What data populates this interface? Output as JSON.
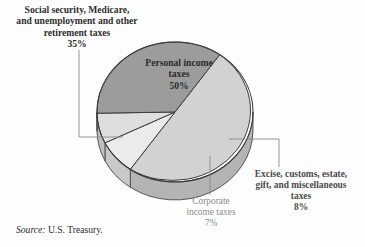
{
  "figure": {
    "source_prefix": "Source:",
    "source_text": " U.S. Treasury."
  },
  "labels": {
    "social": "Social security, Medicare,\nand unemployment and other\nretirement taxes\n35%",
    "personal": "Personal income\ntaxes\n50%",
    "excise": "Excise, customs, estate,\ngift, and miscellaneous\ntaxes\n8%",
    "corporate": "Corporate\nincome taxes\n7%"
  },
  "chart_data": {
    "type": "pie",
    "title": "",
    "subtitle": "",
    "xlabel": "",
    "ylabel": "",
    "legend_position": "callout-labels",
    "grid": false,
    "three_d": true,
    "units": "percent",
    "categories": [
      "Personal income taxes",
      "Excise, customs, estate, gift, and miscellaneous taxes",
      "Corporate income taxes",
      "Social security, Medicare, and unemployment and other retirement taxes"
    ],
    "values": [
      50,
      8,
      7,
      35
    ],
    "slice_labels": [
      "50%",
      "8%",
      "7%",
      "35%"
    ],
    "colors": [
      "#d2d2d2",
      "#ebebeb",
      "#dedede",
      "#9c9c9c"
    ],
    "side_colors": [
      "#b4b4b4",
      "#c9c9c9",
      "#bfbfbf",
      "#848484"
    ],
    "annotations": [
      "Social security, Medicare, and unemployment and other retirement taxes 35%",
      "Personal income taxes 50%",
      "Excise, customs, estate, gift, and miscellaneous taxes 8%",
      "Corporate income taxes 7%"
    ]
  }
}
